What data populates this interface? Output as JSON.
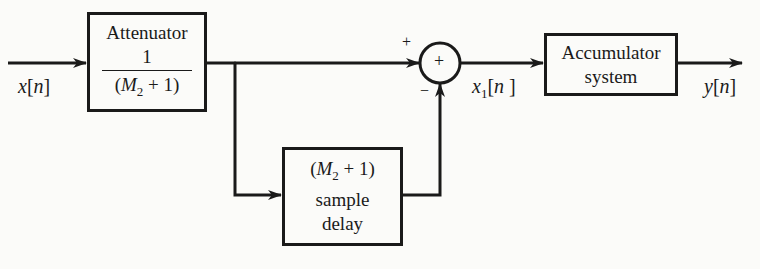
{
  "diagram": {
    "type": "block-diagram",
    "input": {
      "label": "x[n]",
      "var": "x",
      "idx": "n"
    },
    "attenuator": {
      "title": "Attenuator",
      "numerator": "1",
      "denominator_var": "M",
      "denominator_sub": "2",
      "denominator_rest": " + 1"
    },
    "delay": {
      "line1_var": "M",
      "line1_sub": "2",
      "line1_rest": " + 1",
      "line2": "sample",
      "line3": "delay"
    },
    "summer": {
      "symbol": "+",
      "plus_input": "+",
      "minus_input": "−"
    },
    "intermediate": {
      "var": "x",
      "sub": "1",
      "idx": "n"
    },
    "accumulator": {
      "line1": "Accumulator",
      "line2": "system"
    },
    "output": {
      "var": "y",
      "idx": "n"
    },
    "colors": {
      "ink": "#1a1a1a",
      "background": "#fbfbf9"
    }
  }
}
